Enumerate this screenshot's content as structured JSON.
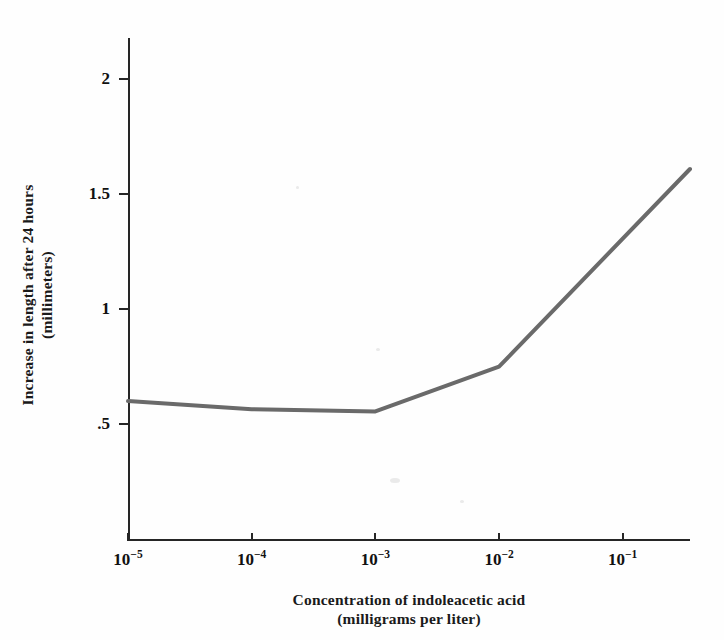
{
  "figure": {
    "background_color": "#fefefe",
    "line_color": "#6a6a6a",
    "axis_color": "#262626"
  },
  "chart_data": {
    "type": "line",
    "title": "",
    "xlabel": "Concentration of indoleacetic acid\n(milligrams per liter)",
    "ylabel": "Increase in length after 24 hours\n(millimeters)",
    "xscale": "log",
    "yscale": "linear",
    "xlim": [
      1e-05,
      0.35
    ],
    "ylim": [
      0,
      2.18
    ],
    "grid": false,
    "legend": null,
    "x_tick_labels": [
      "10⁻⁵",
      "10⁻⁴",
      "10⁻³",
      "10⁻²",
      "10⁻¹"
    ],
    "x_tick_bases": [
      "10",
      "10",
      "10",
      "10",
      "10"
    ],
    "x_tick_exponents": [
      "-5",
      "-4",
      "-3",
      "-2",
      "-1"
    ],
    "x_tick_values": [
      1e-05,
      0.0001,
      0.001,
      0.01,
      0.1
    ],
    "y_tick_labels": [
      ".5",
      "1",
      "1.5",
      "2"
    ],
    "y_tick_values": [
      0.5,
      1.0,
      1.5,
      2.0
    ],
    "series": [
      {
        "name": "Increase in length",
        "color": "#6a6a6a",
        "line_width": 4,
        "x": [
          1e-05,
          0.0001,
          0.001,
          0.01,
          0.35
        ],
        "y": [
          0.6,
          0.565,
          0.555,
          0.75,
          1.61
        ]
      }
    ]
  }
}
